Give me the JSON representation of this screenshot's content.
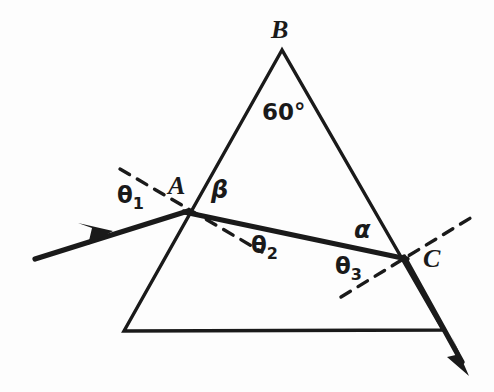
{
  "figure": {
    "kind": "optics-ray-diagram",
    "background_color": "#fdfdfd",
    "ink_color": "#1a1a1a"
  },
  "labels": {
    "apex_vertex": "B",
    "entry_vertex": "A",
    "exit_vertex": "C",
    "apex_angle": "60°",
    "incident_angle": "θ1",
    "incident_angle_base": "θ",
    "incident_angle_sub": "1",
    "internal_angle_at_a": "θ2",
    "internal_angle_at_a_base": "θ",
    "internal_angle_at_a_sub": "2",
    "internal_angle_at_c": "θ3",
    "internal_angle_at_c_base": "θ",
    "internal_angle_at_c_sub": "3",
    "beta_angle": "β",
    "alpha_angle": "α"
  },
  "geometry": {
    "prism_vertices": {
      "B_apex": [
        282,
        50
      ],
      "bottom_left": [
        124,
        331
      ],
      "bottom_right": [
        443,
        330
      ]
    },
    "point_A": [
      186,
      212
    ],
    "point_C": [
      405,
      258
    ],
    "incident_ray": {
      "start": [
        35,
        259
      ],
      "end": [
        186,
        212
      ]
    },
    "internal_ray": {
      "start": [
        186,
        212
      ],
      "end": [
        405,
        258
      ]
    },
    "exit_ray": {
      "start": [
        405,
        258
      ],
      "end": [
        466,
        370
      ]
    },
    "normal_at_A": {
      "start": [
        120,
        169
      ],
      "end": [
        262,
        252
      ]
    },
    "normal_at_C": {
      "start": [
        341,
        297
      ],
      "end": [
        477,
        214
      ]
    }
  },
  "style": {
    "prism_stroke_width": 3,
    "ray_stroke_width": 5,
    "normal_stroke_width": 3,
    "normal_dash": "11 9"
  }
}
